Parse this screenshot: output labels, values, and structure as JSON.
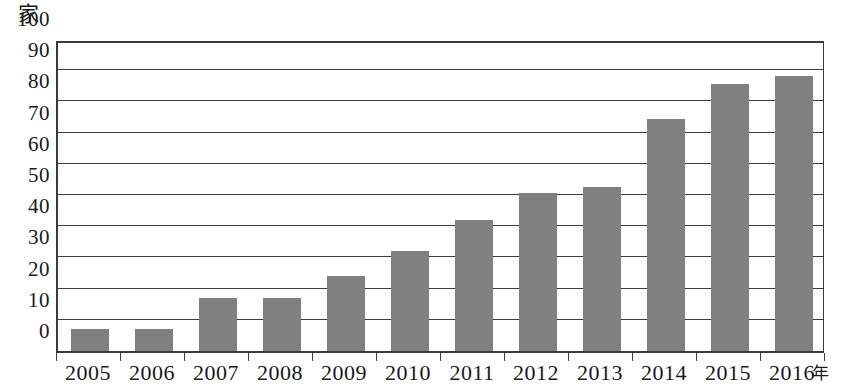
{
  "chart_data": {
    "type": "bar",
    "title": "",
    "subtitle": "",
    "xlabel": "年",
    "ylabel": "家",
    "categories": [
      "2005",
      "2006",
      "2007",
      "2008",
      "2009",
      "2010",
      "2011",
      "2012",
      "2013",
      "2014",
      "2015",
      "2016"
    ],
    "values": [
      7,
      7,
      17,
      17,
      24,
      32,
      42,
      50.5,
      52.5,
      74.5,
      85.5,
      88
    ],
    "series": [
      {
        "name": "",
        "values": [
          7,
          7,
          17,
          17,
          24,
          32,
          42,
          50.5,
          52.5,
          74.5,
          85.5,
          88
        ]
      }
    ],
    "ylim": [
      0,
      100
    ],
    "ytick_labels": [
      "0",
      "10",
      "20",
      "30",
      "40",
      "50",
      "60",
      "70",
      "80",
      "90",
      "100"
    ],
    "ytick_values": [
      0,
      10,
      20,
      30,
      40,
      50,
      60,
      70,
      80,
      90,
      100
    ],
    "grid": true,
    "grid_axis": "y",
    "legend": false,
    "legend_position": "none",
    "bar_color": "#808080",
    "axis_color": "#3d3d3d",
    "background_color": "#ffffff"
  }
}
